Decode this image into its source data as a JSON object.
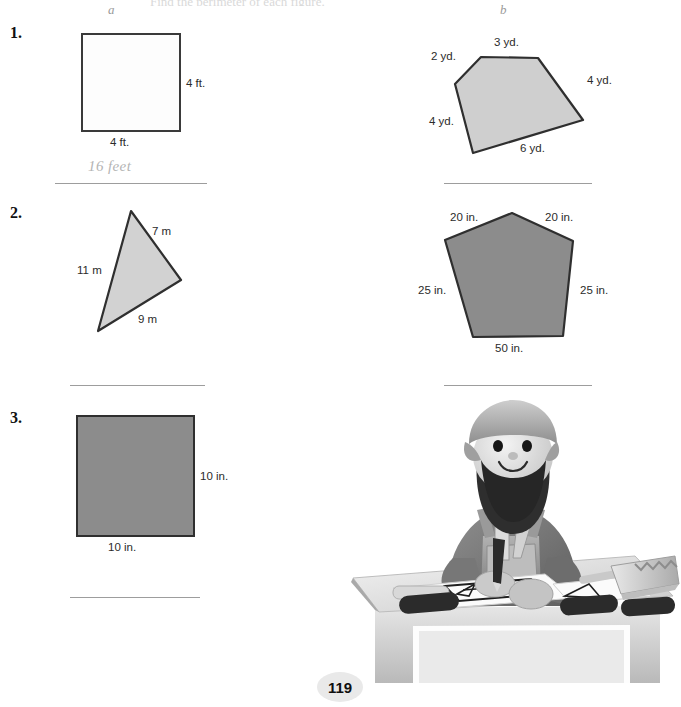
{
  "page": {
    "number": "119",
    "clipped_header": "Find the perimeter of each figure.",
    "columns": [
      {
        "label": "a"
      },
      {
        "label": "b"
      }
    ]
  },
  "problems": [
    {
      "number": "1.",
      "a": {
        "shape": "square-white",
        "labels": [
          {
            "text": "4 ft.",
            "position": "right"
          },
          {
            "text": "4 ft.",
            "position": "bottom"
          }
        ],
        "answer": "16 feet"
      },
      "b": {
        "shape": "pentagon-irregular",
        "labels": [
          {
            "text": "2 yd.",
            "position": "upper-left"
          },
          {
            "text": "3 yd.",
            "position": "top"
          },
          {
            "text": "4 yd.",
            "position": "upper-right"
          },
          {
            "text": "4 yd.",
            "position": "left"
          },
          {
            "text": "6 yd.",
            "position": "bottom"
          }
        ],
        "answer": ""
      }
    },
    {
      "number": "2.",
      "a": {
        "shape": "triangle",
        "labels": [
          {
            "text": "7 m",
            "position": "upper-right"
          },
          {
            "text": "11 m",
            "position": "left"
          },
          {
            "text": "9 m",
            "position": "bottom-right"
          }
        ],
        "answer": ""
      },
      "b": {
        "shape": "pentagon-regular",
        "labels": [
          {
            "text": "20 in.",
            "position": "upper-left"
          },
          {
            "text": "20 in.",
            "position": "upper-right"
          },
          {
            "text": "25 in.",
            "position": "left"
          },
          {
            "text": "25 in.",
            "position": "right"
          },
          {
            "text": "50 in.",
            "position": "bottom"
          }
        ],
        "answer": ""
      }
    },
    {
      "number": "3.",
      "a": {
        "shape": "square-gray",
        "labels": [
          {
            "text": "10 in.",
            "position": "right"
          },
          {
            "text": "10 in.",
            "position": "bottom"
          }
        ],
        "answer": ""
      },
      "b": {
        "shape": "illustration-carpenter-at-workbench",
        "labels": [],
        "answer": ""
      }
    }
  ],
  "colors": {
    "shape_fill_light": "#cfcfcf",
    "shape_fill_dark": "#8c8c8c",
    "shape_stroke": "#2f2f2f",
    "rule_line": "#9d9d9d",
    "handwriting": "#b4b4b4"
  }
}
